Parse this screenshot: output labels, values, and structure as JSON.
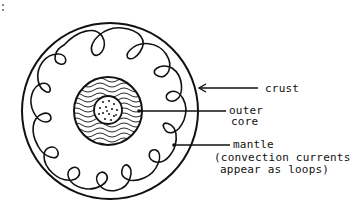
{
  "diagram": {
    "labels": {
      "crust": "crust",
      "outer_core_line1": "outer",
      "outer_core_line2": "core",
      "mantle": "mantle",
      "mantle_note_line1": "(convection currents",
      "mantle_note_line2": "appear as loops)"
    },
    "layers": [
      "inner core (dotted)",
      "outer core (wavy lines)",
      "mantle (loops)",
      "crust (outer ring)"
    ],
    "loop_count": 10,
    "colors": {
      "ink": "#111111",
      "background": "#ffffff"
    }
  }
}
